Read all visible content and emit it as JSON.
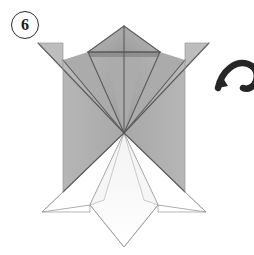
{
  "diagram": {
    "kind": "origami-folding-step",
    "step_badge": {
      "number": "6",
      "shape": "circle"
    },
    "symbols": [
      {
        "name": "turn-over-arrow",
        "meaning": "turn the model over",
        "color": "#262626",
        "clipped_at_right_edge": true
      }
    ],
    "canvas": {
      "width": 254,
      "height": 255,
      "background": "#ffffff"
    },
    "palette": {
      "paper_front_gray": "#b0b0b0",
      "paper_front_gray_light": "#bfbfbf",
      "paper_front_gray_dark": "#9a9a9a",
      "paper_back_white": "#ffffff",
      "crease_line": "#5a5a5a",
      "thin_outline": "#8d8d8d",
      "badge_outline": "#2b2b2b"
    },
    "geometry": {
      "center_x": 124,
      "apex_top": {
        "x": 124,
        "y": 26
      },
      "wing_tip_left": {
        "x": 38,
        "y": 43
      },
      "wing_tip_right": {
        "x": 209,
        "y": 43
      },
      "horizontal_crease": {
        "y": 52,
        "x_start": 88,
        "x_end": 160
      },
      "body_left_edge_x": 63,
      "body_right_edge_x": 185,
      "body_bottom_y": 192,
      "convergence_point": {
        "x": 124,
        "y": 133
      },
      "lower_tip_left": {
        "x": 42,
        "y": 212
      },
      "lower_tip_right": {
        "x": 206,
        "y": 212
      },
      "bottom_point": {
        "x": 124,
        "y": 247
      },
      "lower_diamond_left": {
        "x": 90,
        "y": 205
      },
      "lower_diamond_right": {
        "x": 158,
        "y": 205
      }
    }
  }
}
